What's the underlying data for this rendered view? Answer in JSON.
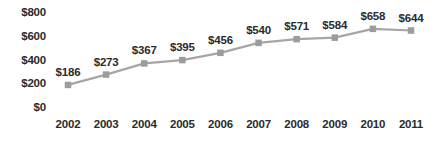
{
  "chart_data": {
    "type": "line",
    "title": "",
    "subtitle": "",
    "xlabel": "",
    "ylabel": "",
    "categories": [
      "2002",
      "2003",
      "2004",
      "2005",
      "2006",
      "2007",
      "2008",
      "2009",
      "2010",
      "2011"
    ],
    "values": [
      186,
      273,
      367,
      395,
      456,
      540,
      571,
      584,
      658,
      644
    ],
    "point_labels": [
      "$186",
      "$273",
      "$367",
      "$395",
      "$456",
      "$540",
      "$571",
      "$584",
      "$658",
      "$644"
    ],
    "ytick_labels": [
      "$800",
      "$600",
      "$400",
      "$200",
      "$0"
    ],
    "ytick_values": [
      800,
      600,
      400,
      200,
      0
    ],
    "ylim": [
      0,
      800
    ],
    "grid": false,
    "legend": false,
    "legend_position": "none",
    "marker": "square",
    "series": [
      {
        "name": "",
        "values": [
          186,
          273,
          367,
          395,
          456,
          540,
          571,
          584,
          658,
          644
        ]
      }
    ],
    "colors": {
      "line": "#a6a6a6",
      "marker": "#9c9c9c",
      "text": "#2b2b2b",
      "background": "#ffffff"
    }
  }
}
